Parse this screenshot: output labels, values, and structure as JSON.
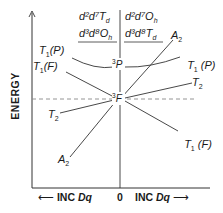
{
  "diagram": {
    "type": "orgel-diagram",
    "y_axis_label": "ENERGY",
    "x_axis": {
      "left_label": "INC",
      "left_var": "Dq",
      "center_label": "0",
      "right_label": "INC",
      "right_var": "Dq"
    },
    "headers": {
      "left": {
        "line1": "d²d⁷",
        "line1_sym": "T",
        "line1_sub": "d",
        "line2": "d³d⁸",
        "line2_sym": "O",
        "line2_sub": "h"
      },
      "right": {
        "line1": "d²d⁷",
        "line1_sym": "O",
        "line1_sub": "h",
        "line2": "d³d⁸",
        "line2_sym": "T",
        "line2_sub": "d"
      }
    },
    "free_ion_terms": [
      {
        "name": "³P",
        "sup": "3",
        "letter": "P"
      },
      {
        "name": "³F",
        "sup": "3",
        "letter": "F"
      }
    ],
    "left_states": [
      {
        "label": "T",
        "sub": "1",
        "suffix": "(P)",
        "origin": "³P"
      },
      {
        "label": "T",
        "sub": "1",
        "suffix": "(F)",
        "origin": "³F"
      },
      {
        "label": "T",
        "sub": "2",
        "suffix": "",
        "origin": "³F"
      },
      {
        "label": "A",
        "sub": "2",
        "suffix": "",
        "origin": "³F"
      }
    ],
    "right_states": [
      {
        "label": "A",
        "sub": "2",
        "suffix": "",
        "origin": "³F"
      },
      {
        "label": "T",
        "sub": "1",
        "suffix": " (P)",
        "origin": "³P"
      },
      {
        "label": "T",
        "sub": "2",
        "suffix": "",
        "origin": "³F"
      },
      {
        "label": "T",
        "sub": "1",
        "suffix": " (F)",
        "origin": "³F"
      }
    ],
    "colors": {
      "line": "#333333",
      "dash": "#888888",
      "text": "#1a1a1a"
    }
  }
}
